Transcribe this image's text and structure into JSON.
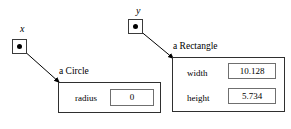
{
  "diagram": {
    "type": "object-reference-diagram",
    "background": "#ffffff",
    "line_color": "#000000",
    "box_border_color": "#2f2f2f",
    "field_border_color": "#6f6f6f"
  },
  "references": [
    {
      "name": "x",
      "label": "x",
      "points_to": "a Circle",
      "dot_icon": "filled-dot-icon"
    },
    {
      "name": "y",
      "label": "y",
      "points_to": "a Rectangle",
      "dot_icon": "filled-dot-icon"
    }
  ],
  "objects": [
    {
      "id": "circle",
      "title": "a Circle",
      "fields": [
        {
          "name": "radius",
          "label": "radius",
          "value": "0"
        }
      ]
    },
    {
      "id": "rectangle",
      "title": "a Rectangle",
      "fields": [
        {
          "name": "width",
          "label": "width",
          "value": "10.128"
        },
        {
          "name": "height",
          "label": "height",
          "value": "5.734"
        }
      ]
    }
  ]
}
